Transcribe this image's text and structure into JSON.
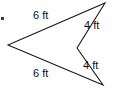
{
  "figure": {
    "name": "concave-arrow-polygon",
    "stroke_color": "#1a1a1a",
    "fill_color": "#ffffff",
    "background_color": "#ffffff",
    "stroke_width": 1,
    "vertices": [
      {
        "name": "left-point",
        "x": 8,
        "y": 45
      },
      {
        "name": "top-right-point",
        "x": 105,
        "y": 3
      },
      {
        "name": "middle-notch",
        "x": 77,
        "y": 48
      },
      {
        "name": "bottom-right-point",
        "x": 103,
        "y": 85
      }
    ],
    "path": "M 8 45 L 105 3 L 77 48 L 103 85 Z",
    "sides": [
      {
        "name": "top-side",
        "label": "6 ft",
        "from": "left-point",
        "to": "top-right-point"
      },
      {
        "name": "upper-right-side",
        "label": "4 ft",
        "from": "top-right-point",
        "to": "middle-notch"
      },
      {
        "name": "lower-right-side",
        "label": "4 ft",
        "from": "middle-notch",
        "to": "bottom-right-point"
      },
      {
        "name": "bottom-side",
        "label": "6 ft",
        "from": "bottom-right-point",
        "to": "left-point"
      }
    ],
    "labels": {
      "top": "6 ft",
      "upper_right": "4 ft",
      "lower_right": "4 ft",
      "bottom": "6 ft"
    },
    "unit": "ft"
  }
}
